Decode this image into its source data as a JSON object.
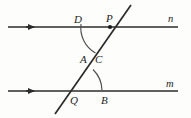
{
  "figure": {
    "type": "geometry-diagram",
    "background_color": "#fdfdfc",
    "stroke_color": "#2b2b2b",
    "arc_color": "#4a4a4a",
    "width": 191,
    "height": 118,
    "lines": [
      {
        "name": "line-n",
        "label": "n",
        "label_x": 168,
        "label_y": 14,
        "y": 27,
        "x_start": 8,
        "x_end": 178,
        "arrow": "right",
        "arrow_x": 33
      },
      {
        "name": "line-m",
        "label": "m",
        "label_x": 166,
        "label_y": 79,
        "y": 91,
        "x_start": 8,
        "x_end": 178,
        "arrow": "right",
        "arrow_x": 33
      }
    ],
    "transversal": {
      "name": "transversal",
      "x_start": 55,
      "y_start": 114,
      "x_end": 131,
      "y_end": 5
    },
    "points": [
      {
        "label": "D",
        "x": 74,
        "y": 14,
        "marker": false
      },
      {
        "label": "P",
        "x": 106,
        "y": 13,
        "marker": true,
        "marker_x": 110,
        "marker_y": 27
      },
      {
        "label": "A",
        "x": 80,
        "y": 54,
        "marker": false
      },
      {
        "label": "C",
        "x": 95,
        "y": 54,
        "marker": false
      },
      {
        "label": "Q",
        "x": 70,
        "y": 95,
        "marker": false
      },
      {
        "label": "B",
        "x": 101,
        "y": 95,
        "marker": false
      }
    ],
    "arcs": [
      {
        "name": "angle-arc-at-p",
        "center_x": 110,
        "center_y": 27,
        "radius": 29,
        "start_x": 81,
        "start_y": 24,
        "end_x": 95,
        "end_y": 53
      },
      {
        "name": "angle-arc-at-q",
        "center_x": 72,
        "center_y": 91,
        "radius": 30,
        "start_x": 93,
        "start_y": 69,
        "end_x": 102,
        "end_y": 90
      }
    ]
  }
}
